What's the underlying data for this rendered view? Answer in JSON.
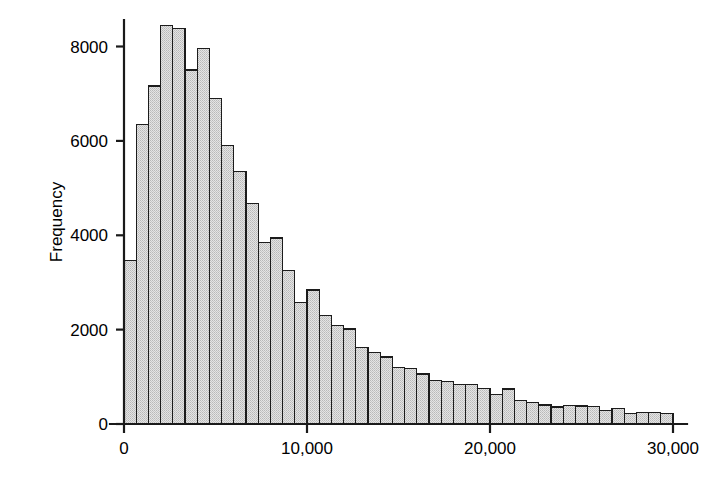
{
  "chart_data": {
    "type": "bar",
    "title": "",
    "subtitle": "",
    "xlabel": "",
    "ylabel": "Frequency",
    "grid": false,
    "legend": null,
    "bar_style": {
      "fill_color": "#d9d9d9",
      "edge_color": "#1c1c1c",
      "fill_pattern": "stipple-dots"
    },
    "xlim": [
      0,
      30000
    ],
    "ylim": [
      0,
      8800
    ],
    "bin_width": 667,
    "bin_count": 45,
    "x_tick_values": [
      0,
      10000,
      20000,
      30000
    ],
    "x_tick_labels": [
      "0",
      "10,000",
      "20,000",
      "30,000"
    ],
    "y_tick_values": [
      0,
      2000,
      4000,
      6000,
      8000
    ],
    "y_tick_labels": [
      "0",
      "2000",
      "4000",
      "6000",
      "8000"
    ],
    "bin_starts": [
      0,
      667,
      1333,
      2000,
      2667,
      3333,
      4000,
      4667,
      5333,
      6000,
      6667,
      7333,
      8000,
      8667,
      9333,
      10000,
      10667,
      11333,
      12000,
      12667,
      13333,
      14000,
      14667,
      15333,
      16000,
      16667,
      17333,
      18000,
      18667,
      19333,
      20000,
      20667,
      21333,
      22000,
      22667,
      23333,
      24000,
      24667,
      25333,
      26000,
      26667,
      27333,
      28000,
      28667,
      29333
    ],
    "categories": [
      "0-667",
      "667-1333",
      "1333-2000",
      "2000-2667",
      "2667-3333",
      "3333-4000",
      "4000-4667",
      "4667-5333",
      "5333-6000",
      "6000-6667",
      "6667-7333",
      "7333-8000",
      "8000-8667",
      "8667-9333",
      "9333-10000",
      "10000-10667",
      "10667-11333",
      "11333-12000",
      "12000-12667",
      "12667-13333",
      "13333-14000",
      "14000-14667",
      "14667-15333",
      "15333-16000",
      "16000-16667",
      "16667-17333",
      "17333-18000",
      "18000-18667",
      "18667-19333",
      "19333-20000",
      "20000-20667",
      "20667-21333",
      "21333-22000",
      "22000-22667",
      "22667-23333",
      "23333-24000",
      "24000-24667",
      "24667-25333",
      "25333-26000",
      "26000-26667",
      "26667-27333",
      "27333-28000",
      "28000-28667",
      "28667-29333",
      "29333-30000"
    ],
    "values": [
      3460,
      6350,
      7160,
      8450,
      8380,
      7500,
      7960,
      6900,
      5900,
      5350,
      4680,
      3840,
      3940,
      3260,
      2570,
      2840,
      2300,
      2090,
      2010,
      1620,
      1520,
      1420,
      1200,
      1180,
      1060,
      920,
      900,
      830,
      840,
      750,
      620,
      740,
      500,
      460,
      400,
      360,
      390,
      380,
      370,
      290,
      330,
      230,
      250,
      240,
      220
    ]
  }
}
